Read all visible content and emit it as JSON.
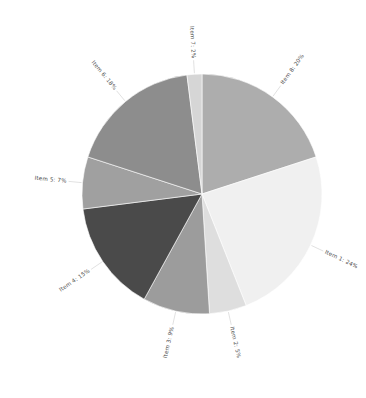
{
  "chart_data": {
    "type": "pie",
    "title": "",
    "subtitle": "",
    "xlabel": "",
    "ylabel": "",
    "legend_position": "none",
    "grid": false,
    "labels_show_percent": true,
    "start_angle_deg": 0,
    "direction": "clockwise",
    "categories": [
      "Item 8",
      "Item 1",
      "Item 2",
      "Item 3",
      "Item 4",
      "Item 5",
      "Item 6",
      "Item 7"
    ],
    "values": [
      20,
      24,
      5,
      9,
      15,
      7,
      18,
      2
    ],
    "total": 100,
    "slices": [
      {
        "name": "Item 8",
        "value": 20,
        "percent_text": "20%",
        "label": "Item 8: 20%",
        "color": "#adadad"
      },
      {
        "name": "Item 1",
        "value": 24,
        "percent_text": "24%",
        "label": "Item 1: 24%",
        "color": "#f0f0f0"
      },
      {
        "name": "Item 2",
        "value": 5,
        "percent_text": "5%",
        "label": "Item 2: 5%",
        "color": "#dedede"
      },
      {
        "name": "Item 3",
        "value": 9,
        "percent_text": "9%",
        "label": "Item 3: 9%",
        "color": "#9c9c9c"
      },
      {
        "name": "Item 4",
        "value": 15,
        "percent_text": "15%",
        "label": "Item 4: 15%",
        "color": "#4a4a4a"
      },
      {
        "name": "Item 5",
        "value": 7,
        "percent_text": "7%",
        "label": "Item 5: 7%",
        "color": "#a0a0a0"
      },
      {
        "name": "Item 6",
        "value": 18,
        "percent_text": "18%",
        "label": "Item 6: 18%",
        "color": "#8d8d8d"
      },
      {
        "name": "Item 7",
        "value": 2,
        "percent_text": "2%",
        "label": "Item 7: 2%",
        "color": "#d6d6d6"
      }
    ],
    "geometry": {
      "center_x": 202,
      "center_y": 194,
      "radius": 120,
      "label_radius": 136,
      "leader_inner_radius": 121,
      "leader_outer_radius": 134
    },
    "colors": {
      "background": "#ffffff",
      "label_text": "#4c4c4c",
      "leader_line": "#d9d9d9",
      "slice_border": "#ffffff"
    }
  }
}
